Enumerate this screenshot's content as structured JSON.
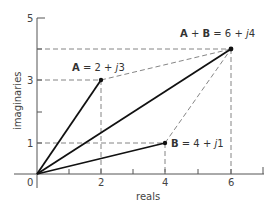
{
  "diagram": {
    "axes": {
      "x_label": "reals",
      "y_label": "imaginaries",
      "x_ticks": [
        "0",
        "2",
        "4",
        "6"
      ],
      "y_ticks": [
        "1",
        "3",
        "5"
      ],
      "x_minor_ticks": [
        1,
        2,
        3,
        4,
        5,
        6,
        7
      ],
      "y_minor_ticks": [
        1,
        2,
        3,
        4,
        5
      ]
    },
    "points": {
      "A": {
        "label": "A = 2 + j3",
        "bold": "A",
        "rest": " = 2 + ",
        "j": "j",
        "num": "3",
        "x": 2,
        "y": 3
      },
      "B": {
        "label": "B = 4 + j1",
        "bold": "B",
        "rest": " = 4 + ",
        "j": "j",
        "num": "1",
        "x": 4,
        "y": 1
      },
      "sum": {
        "label": "A + B = 6 + j4",
        "bold_a": "A",
        "plus": " + ",
        "bold_b": "B",
        "rest": " = 6 + ",
        "j": "j",
        "num": "4",
        "x": 6,
        "y": 4
      }
    },
    "colors": {
      "vector": "#111111",
      "dashed": "#666666",
      "axis": "#555555"
    }
  }
}
